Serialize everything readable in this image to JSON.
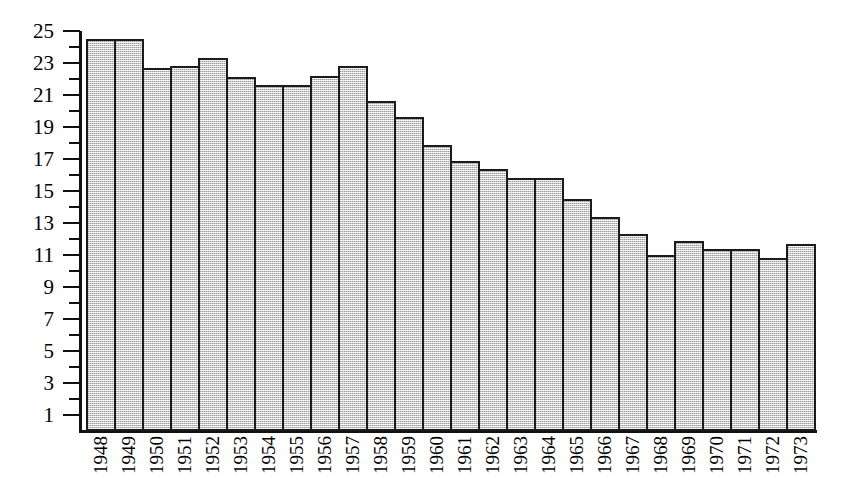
{
  "chart_data": {
    "type": "bar",
    "title": "",
    "subtitle": "",
    "xlabel": "",
    "ylabel": "",
    "categories": [
      "1948",
      "1949",
      "1950",
      "1951",
      "1952",
      "1953",
      "1954",
      "1955",
      "1956",
      "1957",
      "1958",
      "1959",
      "1960",
      "1961",
      "1962",
      "1963",
      "1964",
      "1965",
      "1966",
      "1967",
      "1968",
      "1969",
      "1970",
      "1971",
      "1972",
      "1973"
    ],
    "values": [
      24.5,
      24.5,
      22.7,
      22.8,
      23.3,
      22.1,
      21.6,
      21.6,
      22.2,
      22.8,
      20.6,
      19.6,
      17.9,
      16.9,
      16.4,
      15.8,
      15.8,
      14.5,
      13.4,
      12.3,
      11.0,
      11.9,
      11.4,
      11.4,
      10.8,
      11.7
    ],
    "ylim": [
      0,
      25
    ],
    "y_ticks_major": [
      1,
      3,
      5,
      7,
      9,
      11,
      13,
      15,
      17,
      19,
      21,
      23,
      25
    ],
    "y_ticks_minor": [
      2,
      4,
      6,
      8,
      10,
      12,
      14,
      16,
      18,
      20,
      22,
      24
    ],
    "y_tick_labels": [
      "1",
      "3",
      "5",
      "7",
      "9",
      "11",
      "13",
      "15",
      "17",
      "19",
      "21",
      "23",
      "25"
    ],
    "grid": false,
    "legend": null,
    "legend_position": "none",
    "bar_fill_color": "#c9c9c9",
    "bar_edge_color": "#1b1b1b",
    "axis_color": "#111111",
    "background_color": "#ffffff"
  }
}
